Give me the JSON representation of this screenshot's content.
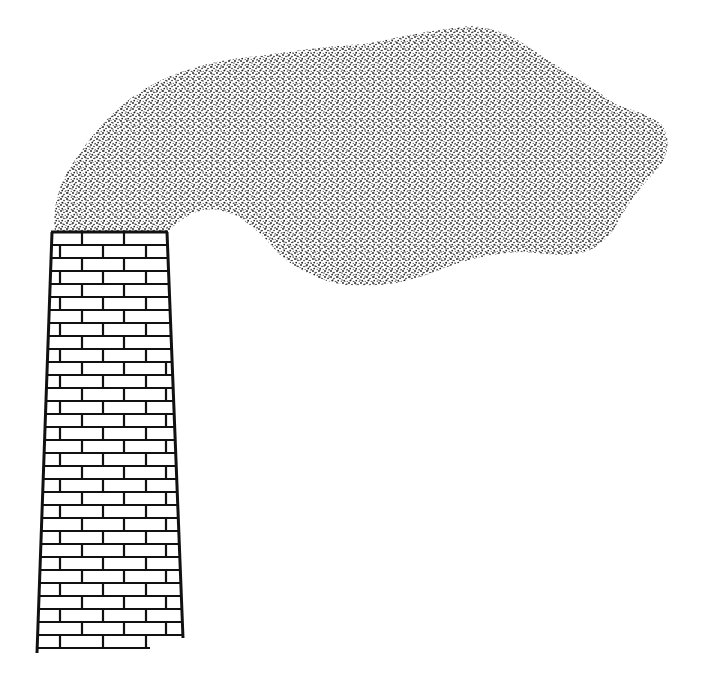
{
  "illustration": {
    "title": "Smokestack emitting smoke",
    "background_color": "#ffffff",
    "ink_color": "#111111",
    "smoke": {
      "label": "smoke cloud",
      "fill_style": "stippled dots",
      "dot_color": "#1a1a1a"
    },
    "chimney": {
      "label": "brick chimney",
      "material": "brick",
      "top_left": [
        52,
        232
      ],
      "top_right": [
        167,
        232
      ],
      "bottom_left": [
        37,
        652
      ],
      "bottom_right": [
        183,
        638
      ],
      "brick_rows": 32,
      "mortar_color": "#111111",
      "brick_color": "#ffffff"
    }
  }
}
